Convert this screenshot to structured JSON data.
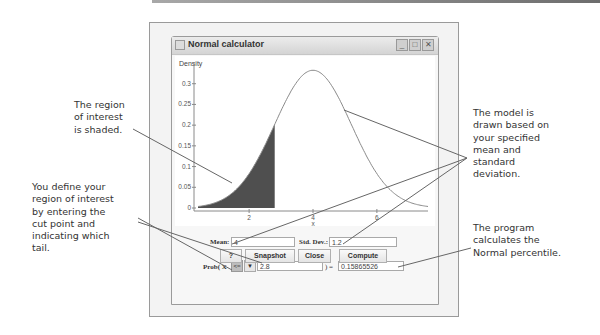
{
  "window": {
    "title": "Normal calculator",
    "controls": [
      "minimize-icon",
      "maximize-icon",
      "close-icon"
    ]
  },
  "form": {
    "mean_label": "Mean:",
    "mean_value": "4",
    "sd_label": "Std. Dev.:",
    "sd_value": "1.2",
    "prob_label": "Prob( X",
    "tail_option": "<=",
    "cut_value": "2.8",
    "equals_label": ") =",
    "result_value": "0.15865526"
  },
  "buttons": {
    "help": "?",
    "snapshot": "Snapshot",
    "close": "Close",
    "compute": "Compute"
  },
  "annotations": {
    "shaded": [
      "The region",
      "of interest",
      "is shaded."
    ],
    "define": [
      "You define your",
      "region of interest",
      "by entering the",
      "cut point and",
      "indicating which",
      "tail."
    ],
    "model": [
      "The model is",
      "drawn based on",
      "your specified",
      "mean and",
      "standard",
      "deviation."
    ],
    "program": [
      "The program",
      "calculates the",
      "Normal percentile."
    ]
  },
  "chart_data": {
    "type": "area",
    "title": "",
    "ylabel": "Density",
    "xlabel": "x",
    "distribution": {
      "name": "Normal",
      "mean": 4,
      "sd": 1.2
    },
    "shaded_region": {
      "tail": "lower",
      "upper_bound": 2.8,
      "probability": 0.15865526
    },
    "xlim": [
      0.4,
      7.6
    ],
    "ylim": [
      0,
      0.35
    ],
    "x_ticks": [
      2,
      4,
      6
    ],
    "y_ticks": [
      0,
      0.05,
      0.1,
      0.15,
      0.2,
      0.25,
      0.3
    ],
    "y_tick_labels": [
      "0",
      "0.05",
      "0.1",
      "0.15",
      "0.2",
      "0.25",
      "0.3"
    ],
    "colors": {
      "curve": "#8a8a8a",
      "shade": "#4f4f4f",
      "axis": "#8a8a8a"
    }
  }
}
